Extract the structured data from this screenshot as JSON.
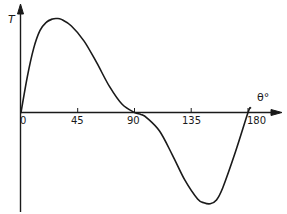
{
  "chart_data": {
    "type": "line",
    "title": "",
    "xlabel": "θ°",
    "ylabel": "T",
    "xlim": [
      0,
      190
    ],
    "ylim": [
      -1.0,
      1.05
    ],
    "grid": false,
    "legend": null,
    "x_ticks": [
      "0",
      "45",
      "90",
      "135",
      "180"
    ],
    "series": [
      {
        "name": "T(θ)",
        "x": [
          0,
          5,
          10,
          15,
          20,
          25,
          28.5,
          32,
          40,
          50,
          60,
          70,
          80,
          90,
          95,
          100,
          110,
          120,
          130,
          140,
          145,
          150,
          155,
          160,
          170,
          180,
          182
        ],
        "y": [
          0,
          0.38,
          0.68,
          0.87,
          0.96,
          0.995,
          1.0,
          0.99,
          0.92,
          0.76,
          0.53,
          0.28,
          0.09,
          0.0,
          -0.02,
          -0.06,
          -0.2,
          -0.45,
          -0.72,
          -0.92,
          -0.96,
          -0.97,
          -0.93,
          -0.8,
          -0.42,
          0.0,
          0.05
        ]
      }
    ],
    "color": "#1a1a1a"
  },
  "labels": {
    "y_axis": "T",
    "x_axis": "θ°",
    "ticks": [
      "0",
      "45",
      "90",
      "135",
      "180"
    ]
  }
}
